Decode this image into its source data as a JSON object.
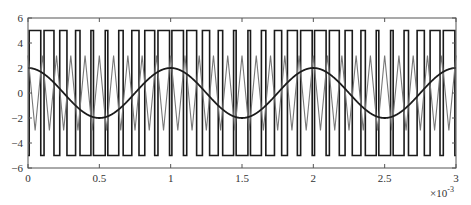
{
  "chart_data": {
    "type": "line",
    "title": "",
    "xlabel": "",
    "ylabel": "",
    "x_multiplier_label": "×10",
    "x_multiplier_exp": "-3",
    "xlim": [
      0,
      3
    ],
    "ylim": [
      -6,
      6
    ],
    "x_ticks": [
      "0",
      "0.5",
      "1",
      "1.5",
      "2",
      "2.5",
      "3"
    ],
    "y_ticks": [
      "6",
      "4",
      "2",
      "0",
      "-2",
      "-4",
      "-6"
    ],
    "grid": false,
    "legend": null,
    "series": [
      {
        "name": "PWM output",
        "kind": "square",
        "amplitude": 5,
        "color": "#1a1a1a",
        "width": 1.6
      },
      {
        "name": "Triangle carrier",
        "kind": "triangle",
        "amplitude": 3,
        "frequency_per_ms": 10,
        "color": "#777777",
        "width": 1.1
      },
      {
        "name": "Sine reference",
        "kind": "sine",
        "amplitude": 2,
        "frequency_per_ms": 1,
        "phase": "cos",
        "color": "#1a1a1a",
        "width": 1.8
      }
    ]
  }
}
